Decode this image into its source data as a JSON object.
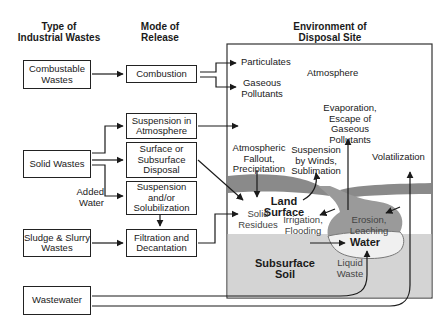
{
  "headers": {
    "col1": "Type of\nIndustrial Wastes",
    "col2": "Mode of\nRelease",
    "col3": "Environment of\nDisposal Site"
  },
  "waste_types": [
    {
      "id": "combustable",
      "label": "Combustable Wastes"
    },
    {
      "id": "solid",
      "label": "Solid Wastes"
    },
    {
      "id": "sludge",
      "label": "Sludge & Slurry Wastes"
    },
    {
      "id": "wastewater",
      "label": "Wastewater"
    }
  ],
  "release_modes": [
    {
      "id": "combustion",
      "label": "Combustion"
    },
    {
      "id": "suspension-atmosphere",
      "label": "Suspension in Atmosphere"
    },
    {
      "id": "surface-disposal",
      "label": "Surface or Subsurface Disposal"
    },
    {
      "id": "suspension-solubilization",
      "label": "Suspension and/or Solubilization"
    },
    {
      "id": "filtration",
      "label": "Filtration and Decantation"
    }
  ],
  "annotations": {
    "added_water": "Added Water"
  },
  "environment": {
    "particulates": "Particulates",
    "gaseous_pollutants": "Gaseous Pollutants",
    "atmosphere": "Atmosphere",
    "evaporation": "Evaporation, Escape of Gaseous Pollutants",
    "atmospheric_fallout": "Atmospheric Fallout, Precipitation",
    "suspension_winds": "Suspension by Winds, Sublimation",
    "volatilization": "Volatilization",
    "land_surface": "Land Surface",
    "solid_residues": "Solid Residues",
    "irrigation": "Irrigation, Flooding",
    "erosion": "Erosion, Leaching",
    "water": "Water",
    "subsurface_soil": "Subsurface Soil",
    "liquid_waste": "Liquid Waste"
  },
  "colors": {
    "subsoil": "#d4d4d4",
    "land_band": "#8a8a8a",
    "water": "#f2f2f2",
    "line": "#1a1a1a"
  }
}
